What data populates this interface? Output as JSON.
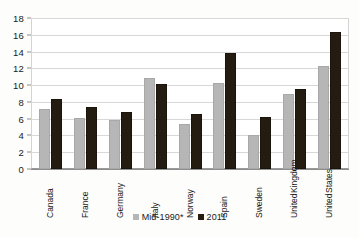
{
  "chart_data": {
    "type": "bar",
    "title": "",
    "subtitle": "",
    "xlabel": "",
    "ylabel": "",
    "ylim": [
      0,
      18
    ],
    "ytick_step": 2,
    "yticks": [
      18,
      16,
      14,
      12,
      10,
      8,
      6,
      4,
      2,
      0
    ],
    "grid": true,
    "legend_position": "bottom-center",
    "categories": [
      "Canada",
      "France",
      "Germany",
      "Italy",
      "Norway",
      "Spain",
      "Sweden",
      "United Kingdom",
      "United States"
    ],
    "category_lines": [
      [
        "Canada"
      ],
      [
        "France"
      ],
      [
        "Germany"
      ],
      [
        "Italy"
      ],
      [
        "Norway"
      ],
      [
        "Spain"
      ],
      [
        "Sweden"
      ],
      [
        "United",
        "Kingdom"
      ],
      [
        "United",
        "States"
      ]
    ],
    "series": [
      {
        "name": "Mid-1990*",
        "color": "#b6b6b6",
        "values": [
          7.2,
          6.1,
          5.9,
          10.8,
          5.4,
          10.2,
          4.0,
          9.0,
          12.3
        ]
      },
      {
        "name": "2011",
        "color": "#241c10",
        "values": [
          8.4,
          7.4,
          6.8,
          10.1,
          6.6,
          13.8,
          6.2,
          9.5,
          16.3
        ]
      }
    ]
  },
  "legend": {
    "items": [
      {
        "label": "Mid-1990*",
        "swatch": "series-0"
      },
      {
        "label": "2011",
        "swatch": "series-1"
      }
    ]
  },
  "colors": {
    "series_0": "#b6b6b6",
    "series_1": "#241c10",
    "gridline": "#d8d8d8",
    "axis": "#8d8d8d",
    "text": "#1a1a1a",
    "plot_background": "#ffffff",
    "page_background": "#fdfdfb"
  }
}
